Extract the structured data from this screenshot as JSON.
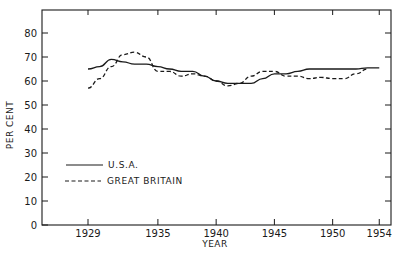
{
  "chart_data": {
    "type": "line",
    "title": "",
    "xlabel": "YEAR",
    "ylabel": "PER CENT",
    "xlim": [
      1926,
      1956
    ],
    "ylim": [
      0,
      90
    ],
    "x_ticks": [
      1929,
      1935,
      1940,
      1945,
      1950,
      1954
    ],
    "x_tick_labels": [
      "1929",
      "1935",
      "1940",
      "1945",
      "1950",
      "1954"
    ],
    "y_ticks": [
      0,
      10,
      20,
      30,
      40,
      50,
      60,
      70,
      80
    ],
    "y_tick_labels": [
      "0",
      "10",
      "20",
      "30",
      "40",
      "50",
      "60",
      "70",
      "80"
    ],
    "grid": false,
    "legend_position": "lower-left inside plot",
    "x": [
      1929,
      1930,
      1931,
      1932,
      1933,
      1934,
      1935,
      1936,
      1937,
      1938,
      1939,
      1940,
      1941,
      1942,
      1943,
      1944,
      1945,
      1946,
      1947,
      1948,
      1949,
      1950,
      1951,
      1952,
      1953,
      1954
    ],
    "series": [
      {
        "name": "U.S.A.",
        "style": "solid",
        "values": [
          65,
          66,
          69,
          68,
          67,
          67,
          66,
          65,
          64,
          64,
          62,
          60,
          59,
          59,
          59,
          61,
          63,
          63,
          64,
          65,
          65,
          65,
          65,
          65,
          65.5,
          65.5
        ]
      },
      {
        "name": "GREAT BRITAIN",
        "style": "dashed",
        "values": [
          57,
          61,
          66,
          71,
          72,
          70,
          64,
          64,
          62,
          63,
          62,
          60,
          58,
          59,
          62,
          64,
          64,
          62,
          62,
          61,
          61.5,
          61,
          61,
          63,
          65,
          null
        ]
      }
    ]
  },
  "legend": {
    "items": [
      {
        "label": "U.S.A.",
        "style": "solid"
      },
      {
        "label": "GREAT BRITAIN",
        "style": "dashed"
      }
    ]
  },
  "colors": {
    "ink": "#1a1a1a",
    "background": "#ffffff"
  }
}
